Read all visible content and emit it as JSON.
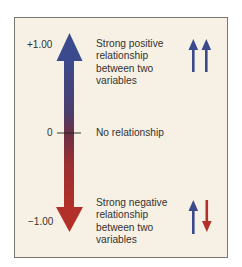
{
  "diagram": {
    "scale": {
      "top_label": "+1.00",
      "mid_label": "0",
      "bottom_label": "−1.00"
    },
    "descriptions": {
      "positive": "Strong positive relationship between two variables",
      "none": "No relationship",
      "negative": "Strong negative relationship between two variables"
    },
    "icons": {
      "positive": [
        "arrow-up",
        "arrow-up"
      ],
      "negative": [
        "arrow-up",
        "arrow-down"
      ]
    },
    "colors": {
      "positive": "#3b4a8c",
      "negative": "#b3302a",
      "background": "#f6f1e4",
      "border": "#7a7670"
    }
  }
}
